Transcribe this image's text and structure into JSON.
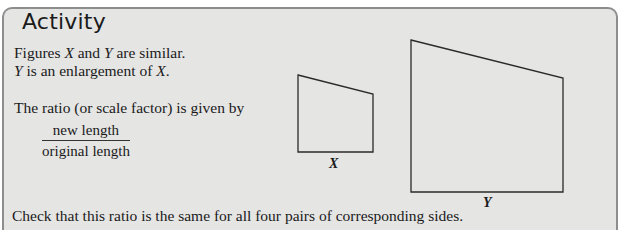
{
  "panel": {
    "title": "Activity"
  },
  "text": {
    "line1_a": "Figures ",
    "line1_x": "X",
    "line1_b": " and ",
    "line1_y": "Y",
    "line1_c": " are similar.",
    "line2_y": "Y",
    "line2_b": " is an enlargement of ",
    "line2_x": "X",
    "line2_c": ".",
    "ratio_line": "The ratio (or scale factor) is given by",
    "fraction_numerator": "new length",
    "fraction_denominator": "original length",
    "bottom_line": "Check that this ratio is the same for all four pairs of corresponding sides."
  },
  "figures": {
    "x": {
      "label": "X",
      "points": "298,75 373,94 373,152 298,152"
    },
    "y": {
      "label": "Y",
      "points": "411,40 563,78 563,192 411,192"
    }
  },
  "colors": {
    "panel_bg": "#e5e5e4",
    "panel_border": "#8d8d8d",
    "shape_stroke": "#2a2a2a"
  }
}
